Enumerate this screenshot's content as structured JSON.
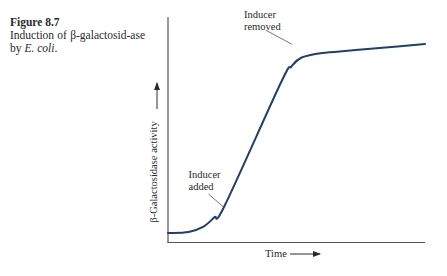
{
  "caption": {
    "figure_number": "Figure 8.7",
    "text_before": "Induction of β-galactosid-ase by ",
    "organism": "E. coli",
    "text_after": "."
  },
  "chart_data": {
    "type": "line",
    "xlabel": "Time",
    "ylabel": "β-Galactosidase activity",
    "x_ticks": [],
    "y_ticks": [],
    "grid": false,
    "xlim": [
      0,
      100
    ],
    "ylim": [
      0,
      100
    ],
    "series": [
      {
        "name": "β-Galactosidase activity",
        "color": "#1f3f70",
        "x": [
          0,
          8,
          14,
          18,
          22,
          44,
          48,
          52,
          60,
          70,
          80,
          100
        ],
        "y": [
          4,
          4.5,
          7,
          11,
          16,
          71,
          78,
          82,
          84,
          85,
          86,
          88
        ]
      }
    ],
    "annotations": [
      {
        "label": "Inducer added",
        "line1": "Inducer",
        "line2": "added",
        "x": 22,
        "y": 16
      },
      {
        "label": "Inducer removed",
        "line1": "Inducer",
        "line2": "removed",
        "x": 49,
        "y": 79
      }
    ]
  }
}
